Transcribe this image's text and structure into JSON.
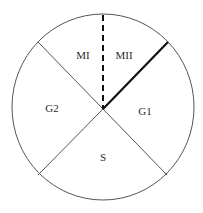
{
  "diagram": {
    "type": "cell-cycle-circle",
    "phases": [
      {
        "id": "M1",
        "label": "MI"
      },
      {
        "id": "M2",
        "label": "MII"
      },
      {
        "id": "G2",
        "label": "G2"
      },
      {
        "id": "G1",
        "label": "G1"
      },
      {
        "id": "S",
        "label": "S"
      }
    ],
    "colors": {
      "line": "#555555",
      "thick_line": "#111111",
      "dashed_line": "#111111",
      "text": "#2a2a2a",
      "background": "#ffffff"
    }
  }
}
